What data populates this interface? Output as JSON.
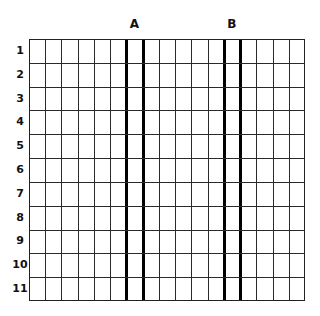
{
  "diagram": {
    "type": "grid",
    "columns": 17,
    "rows": 11,
    "row_labels": [
      "1",
      "2",
      "3",
      "4",
      "5",
      "6",
      "7",
      "8",
      "9",
      "10",
      "11"
    ],
    "column_markers": [
      {
        "label": "A",
        "thick_lines_after_columns": [
          6,
          7
        ]
      },
      {
        "label": "B",
        "thick_lines_after_columns": [
          12,
          13
        ]
      }
    ],
    "colors": {
      "line": "#2a2a2a",
      "thick_line": "#000000",
      "background": "#ffffff",
      "text": "#111111"
    }
  }
}
